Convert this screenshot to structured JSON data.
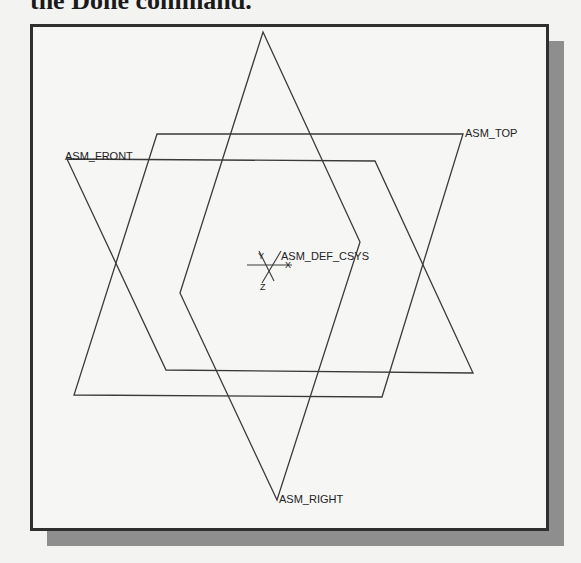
{
  "heading": {
    "text": "the Done command."
  },
  "viewport": {
    "background": "#f6f6f4",
    "frame_color": "#2f2f2f",
    "shadow_color": "#8e8e8e",
    "line_color": "#3a3a3a"
  },
  "datum_planes": [
    {
      "name": "ASM_TOP",
      "label": "ASM_TOP",
      "points": "157,134 463,134 382,397 74,395"
    },
    {
      "name": "ASM_FRONT",
      "label": "ASM_FRONT",
      "points": "67,159 375,161 473,373 166,370"
    },
    {
      "name": "ASM_RIGHT",
      "label": "ASM_RIGHT",
      "points": "263,32 360,242 277,500 180,293"
    }
  ],
  "csys": {
    "label": "ASM_DEF_CSYS",
    "axes": {
      "x": "X",
      "y": "Y",
      "z": "Z"
    }
  }
}
